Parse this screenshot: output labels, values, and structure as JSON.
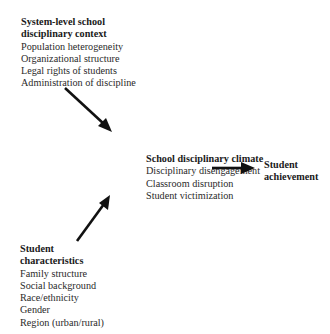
{
  "diagram": {
    "system_context": {
      "title_lines": [
        "System-level school",
        "disciplinary context"
      ],
      "items": [
        "Population heterogeneity",
        "Organizational structure",
        "Legal rights of students",
        "Administration of discipline"
      ]
    },
    "climate": {
      "title_lines": [
        "School disciplinary climate"
      ],
      "items": [
        "Disciplinary disengagement",
        "Classroom disruption",
        "Student victimization"
      ]
    },
    "achievement": {
      "title_lines": [
        "Student",
        "achievement"
      ]
    },
    "student_characteristics": {
      "title_lines": [
        "Student",
        "characteristics"
      ],
      "items": [
        "Family structure",
        "Social background",
        "Race/ethnicity",
        "Gender",
        "Region (urban/rural)"
      ]
    },
    "arrows": [
      {
        "from": "system_context",
        "to": "climate"
      },
      {
        "from": "student_characteristics",
        "to": "climate"
      },
      {
        "from": "climate",
        "to": "achievement"
      }
    ],
    "arrow_color": "#111111"
  }
}
